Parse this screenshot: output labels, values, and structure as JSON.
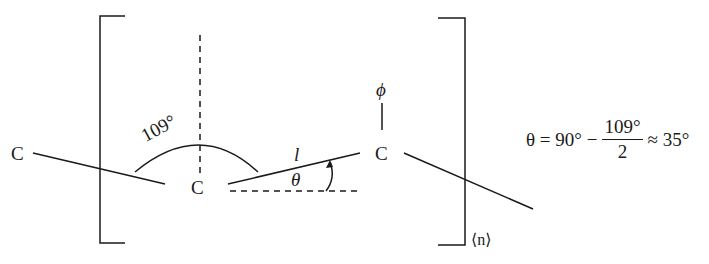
{
  "diagram": {
    "atoms": {
      "left_c": "C",
      "center_c": "C",
      "right_c": "C",
      "substituent": "ϕ"
    },
    "labels": {
      "bond_angle": "109°",
      "bond_length": "l",
      "theta": "θ",
      "repeat_unit": "⟨n⟩"
    },
    "formula": {
      "lhs": "θ = 90° −",
      "numerator": "109°",
      "denominator": "2",
      "rhs": "≈ 35°"
    },
    "colors": {
      "stroke": "#1a1a1a",
      "background": "#ffffff"
    }
  }
}
